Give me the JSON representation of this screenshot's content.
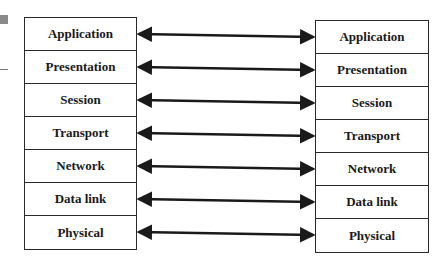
{
  "diagram": {
    "left_stack": {
      "layers": [
        "Application",
        "Presentation",
        "Session",
        "Transport",
        "Network",
        "Data link",
        "Physical"
      ]
    },
    "right_stack": {
      "layers": [
        "Application",
        "Presentation",
        "Session",
        "Transport",
        "Network",
        "Data link",
        "Physical"
      ]
    },
    "arrows": {
      "type": "bidirectional",
      "count": 7,
      "color": "#1a1a1a"
    }
  }
}
